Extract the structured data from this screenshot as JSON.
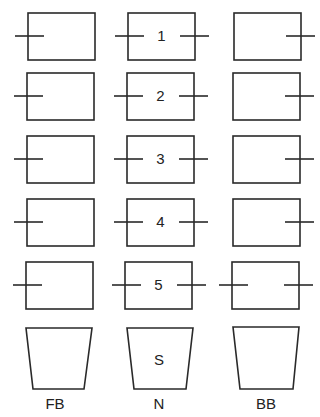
{
  "diagram": {
    "columns": [
      {
        "id": "FB",
        "label": "FB"
      },
      {
        "id": "N",
        "label": "N"
      },
      {
        "id": "BB",
        "label": "BB"
      }
    ],
    "rows": [
      {
        "number": "1",
        "FB": {
          "left_tick": true,
          "right_tick": false
        },
        "N": {
          "left_tick": true,
          "right_tick": true
        },
        "BB": {
          "left_tick": false,
          "right_tick": true
        }
      },
      {
        "number": "2",
        "FB": {
          "left_tick": true,
          "right_tick": false
        },
        "N": {
          "left_tick": true,
          "right_tick": true
        },
        "BB": {
          "left_tick": false,
          "right_tick": true
        }
      },
      {
        "number": "3",
        "FB": {
          "left_tick": true,
          "right_tick": false
        },
        "N": {
          "left_tick": true,
          "right_tick": true
        },
        "BB": {
          "left_tick": false,
          "right_tick": true
        }
      },
      {
        "number": "4",
        "FB": {
          "left_tick": true,
          "right_tick": false
        },
        "N": {
          "left_tick": true,
          "right_tick": true
        },
        "BB": {
          "left_tick": false,
          "right_tick": true
        }
      },
      {
        "number": "5",
        "FB": {
          "left_tick": true,
          "right_tick": false
        },
        "N": {
          "left_tick": true,
          "right_tick": true
        },
        "BB": {
          "left_tick": true,
          "right_tick": true
        }
      }
    ],
    "base": {
      "N_label": "S",
      "FB_label": "",
      "BB_label": ""
    },
    "colors": {
      "stroke": "#2a2a2a",
      "text": "#222222",
      "background": "#ffffff"
    }
  }
}
